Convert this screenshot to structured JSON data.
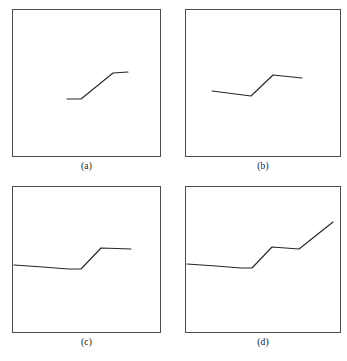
{
  "figure": {
    "background_color": "#ffffff",
    "frame_color": "#4a4a52",
    "line_color": "#262626",
    "panel_count": 4,
    "layout": "2x2 grid"
  },
  "panels": [
    {
      "id": "a",
      "caption": "(a)",
      "frame_width": 149,
      "frame_height": 148,
      "series_label": "segment-1",
      "points": [
        [
          54,
          89
        ],
        [
          68,
          89
        ],
        [
          100,
          63
        ],
        [
          115,
          62
        ]
      ],
      "stroke_width": 1.1
    },
    {
      "id": "b",
      "caption": "(b)",
      "frame_width": 156,
      "frame_height": 148,
      "series_label": "segment-2",
      "points": [
        [
          26,
          81
        ],
        [
          65,
          86
        ],
        [
          87,
          65
        ],
        [
          116,
          68
        ]
      ],
      "stroke_width": 1.1
    },
    {
      "id": "c",
      "caption": "(c)",
      "frame_width": 149,
      "frame_height": 147,
      "series_label": "segment-3",
      "points": [
        [
          1,
          78
        ],
        [
          30,
          80
        ],
        [
          55,
          82
        ],
        [
          68,
          82
        ],
        [
          88,
          61
        ],
        [
          118,
          62
        ]
      ],
      "stroke_width": 1.1
    },
    {
      "id": "d",
      "caption": "(d)",
      "frame_width": 156,
      "frame_height": 147,
      "series_label": "segment-4",
      "points": [
        [
          1,
          77
        ],
        [
          30,
          79
        ],
        [
          55,
          81
        ],
        [
          66,
          81
        ],
        [
          86,
          60
        ],
        [
          113,
          62
        ],
        [
          147,
          35
        ]
      ],
      "stroke_width": 1.1
    }
  ],
  "chart_data": {
    "type": "line",
    "title": "",
    "xlabel": "",
    "ylabel": "",
    "grid": false,
    "legend": "none",
    "subplots": [
      {
        "caption": "(a)",
        "xlim": [
          0,
          149
        ],
        "ylim": [
          148,
          0
        ],
        "series": [
          {
            "name": "segment-1",
            "x": [
              54,
              68,
              100,
              115
            ],
            "y": [
              89,
              89,
              63,
              62
            ]
          }
        ]
      },
      {
        "caption": "(b)",
        "xlim": [
          0,
          156
        ],
        "ylim": [
          148,
          0
        ],
        "series": [
          {
            "name": "segment-2",
            "x": [
              26,
              65,
              87,
              116
            ],
            "y": [
              81,
              86,
              65,
              68
            ]
          }
        ]
      },
      {
        "caption": "(c)",
        "xlim": [
          0,
          149
        ],
        "ylim": [
          147,
          0
        ],
        "series": [
          {
            "name": "segment-3",
            "x": [
              1,
              30,
              55,
              68,
              88,
              118
            ],
            "y": [
              78,
              80,
              82,
              82,
              61,
              62
            ]
          }
        ]
      },
      {
        "caption": "(d)",
        "xlim": [
          0,
          156
        ],
        "ylim": [
          147,
          0
        ],
        "series": [
          {
            "name": "segment-4",
            "x": [
              1,
              30,
              55,
              66,
              86,
              113,
              147
            ],
            "y": [
              77,
              79,
              81,
              81,
              60,
              62,
              35
            ]
          }
        ]
      }
    ]
  }
}
